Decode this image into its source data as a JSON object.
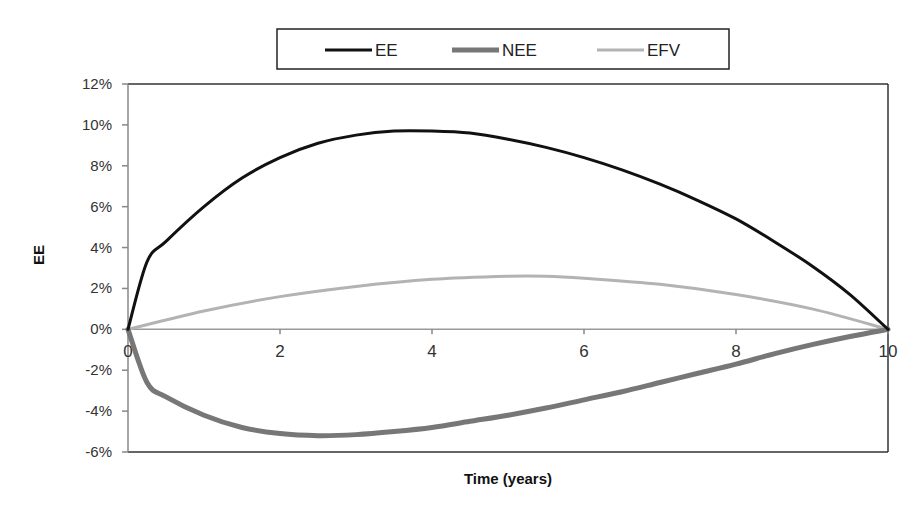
{
  "chart_data": {
    "type": "line",
    "title": "",
    "xlabel": "Time (years)",
    "ylabel": "EE",
    "xlim": [
      0,
      10
    ],
    "ylim": [
      -0.06,
      0.12
    ],
    "x_ticks": [
      0,
      2,
      4,
      6,
      8,
      10
    ],
    "x_tick_labels": [
      "0",
      "2",
      "4",
      "6",
      "8",
      "10"
    ],
    "y_ticks": [
      0.12,
      0.1,
      0.08,
      0.06,
      0.04,
      0.02,
      0.0,
      -0.02,
      -0.04,
      -0.06
    ],
    "y_tick_labels": [
      "12%",
      "10%",
      "8%",
      "6%",
      "4%",
      "2%",
      "0%",
      "-2%",
      "-4%",
      "-6%"
    ],
    "grid": false,
    "legend_position": "top",
    "series": [
      {
        "name": "EE",
        "color": "#111111",
        "width": 3,
        "x": [
          0,
          0.25,
          0.5,
          1,
          1.5,
          2,
          2.5,
          3,
          3.5,
          4,
          4.5,
          5,
          5.5,
          6,
          6.5,
          7,
          7.5,
          8,
          8.5,
          9,
          9.5,
          10
        ],
        "values": [
          0,
          0.033,
          0.043,
          0.06,
          0.074,
          0.084,
          0.091,
          0.095,
          0.097,
          0.097,
          0.096,
          0.093,
          0.089,
          0.084,
          0.078,
          0.071,
          0.063,
          0.054,
          0.043,
          0.031,
          0.017,
          0
        ]
      },
      {
        "name": "NEE",
        "color": "#777777",
        "width": 5,
        "x": [
          0,
          0.25,
          0.5,
          1,
          1.5,
          2,
          2.5,
          3,
          3.5,
          4,
          4.5,
          5,
          5.5,
          6,
          6.5,
          7,
          7.5,
          8,
          8.5,
          9,
          9.5,
          10
        ],
        "values": [
          0,
          -0.026,
          -0.033,
          -0.042,
          -0.048,
          -0.051,
          -0.052,
          -0.0515,
          -0.05,
          -0.048,
          -0.045,
          -0.042,
          -0.0385,
          -0.0345,
          -0.0305,
          -0.026,
          -0.0215,
          -0.017,
          -0.012,
          -0.0075,
          -0.0035,
          0
        ]
      },
      {
        "name": "EFV",
        "color": "#b3b3b3",
        "width": 3,
        "x": [
          0,
          1,
          2,
          3,
          4,
          5,
          5.5,
          6,
          7,
          8,
          9,
          10
        ],
        "values": [
          0,
          0.009,
          0.016,
          0.021,
          0.0245,
          0.026,
          0.026,
          0.025,
          0.022,
          0.017,
          0.01,
          0
        ]
      }
    ]
  }
}
